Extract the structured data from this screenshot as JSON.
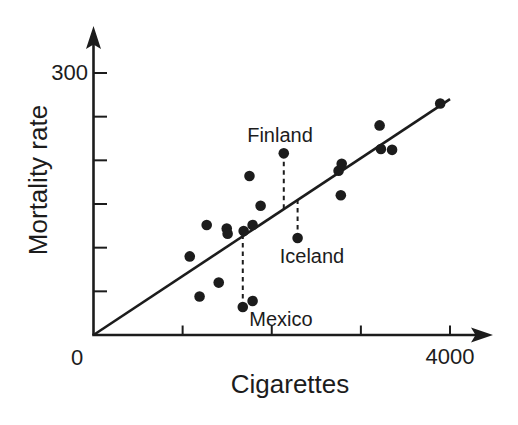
{
  "figure": {
    "background": "#ffffff",
    "ink_color": "#1c1c1c"
  },
  "chart_data": {
    "type": "scatter",
    "title": "",
    "xlabel": "Cigarettes",
    "ylabel": "Mortality rate",
    "origin_label": "0",
    "xlim": [
      0,
      4450
    ],
    "ylim": [
      0,
      345
    ],
    "grid": false,
    "x_ticks": [
      {
        "value": 1000,
        "label": ""
      },
      {
        "value": 2000,
        "label": ""
      },
      {
        "value": 3000,
        "label": ""
      },
      {
        "value": 4000,
        "label": "4000"
      }
    ],
    "y_ticks": [
      {
        "value": 50,
        "label": ""
      },
      {
        "value": 100,
        "label": ""
      },
      {
        "value": 150,
        "label": ""
      },
      {
        "value": 200,
        "label": ""
      },
      {
        "value": 250,
        "label": ""
      },
      {
        "value": 300,
        "label": "300"
      }
    ],
    "points": [
      {
        "x": 1080,
        "y": 90
      },
      {
        "x": 1190,
        "y": 44
      },
      {
        "x": 1270,
        "y": 126
      },
      {
        "x": 1405,
        "y": 60
      },
      {
        "x": 1495,
        "y": 122
      },
      {
        "x": 1505,
        "y": 116
      },
      {
        "x": 1675,
        "y": 32,
        "label": "Mexico"
      },
      {
        "x": 1685,
        "y": 119
      },
      {
        "x": 1750,
        "y": 182
      },
      {
        "x": 1785,
        "y": 126
      },
      {
        "x": 1785,
        "y": 39
      },
      {
        "x": 1875,
        "y": 148
      },
      {
        "x": 2135,
        "y": 208,
        "label": "Finland"
      },
      {
        "x": 2290,
        "y": 111,
        "label": "Iceland"
      },
      {
        "x": 2750,
        "y": 188
      },
      {
        "x": 2785,
        "y": 196
      },
      {
        "x": 2775,
        "y": 160
      },
      {
        "x": 3210,
        "y": 240
      },
      {
        "x": 3225,
        "y": 213
      },
      {
        "x": 3350,
        "y": 212
      },
      {
        "x": 3890,
        "y": 265
      }
    ],
    "fit_line": {
      "x": [
        0,
        4000
      ],
      "y": [
        0,
        270
      ]
    },
    "callout_style": "dashed-vertical-to-fit-line",
    "point_color": "#1c1c1c",
    "line_color": "#1c1c1c"
  }
}
